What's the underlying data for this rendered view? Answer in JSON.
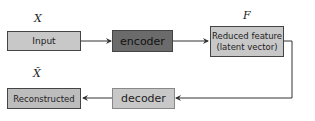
{
  "diagram": {
    "labels": {
      "x": "X",
      "f": "F",
      "x_hat": "X̃"
    },
    "nodes": {
      "input": "Input",
      "encoder": "encoder",
      "reduced_feature_line1": "Reduced feature",
      "reduced_feature_line2": "(latent vector)",
      "decoder": "decoder",
      "reconstructed": "Reconstructed"
    },
    "colors": {
      "input_fill": "#c8c8c8",
      "encoder_fill": "#6b6b6b",
      "feature_fill": "#c8c8c8",
      "decoder_fill": "#c8c8c8",
      "reconstructed_fill": "#bdbdbd",
      "line": "#333333"
    }
  }
}
